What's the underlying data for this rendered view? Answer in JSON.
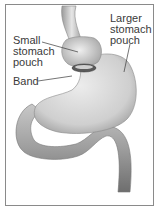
{
  "diagram": {
    "labels": [
      {
        "id": "small-pouch",
        "text": "Small\nstomach\npouch"
      },
      {
        "id": "larger-pouch",
        "text": "Larger\nstomach\npouch"
      },
      {
        "id": "band",
        "text": "Band"
      }
    ],
    "colors": {
      "border": "#8a8a8a",
      "organ_fill": "#d4d4d4",
      "organ_shade": "#8c8c8c",
      "leader_line": "#3a3a3a",
      "text": "#3a3a3a"
    }
  }
}
